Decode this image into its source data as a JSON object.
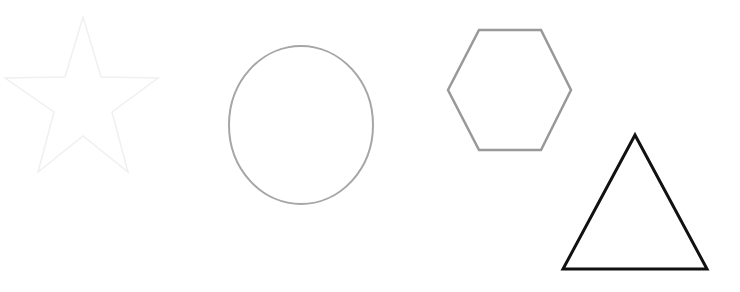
{
  "canvas": {
    "width": 740,
    "height": 292,
    "background": "#ffffff"
  },
  "shapes": [
    {
      "type": "star",
      "label": "star",
      "points": "83,17 101,77 158,78 112,112 128,172 83,136 38,172 54,112 5,78 65,77",
      "stroke": "#f0f0f0",
      "stroke_width": 1.5,
      "fill": "none"
    },
    {
      "type": "ellipse",
      "label": "circle",
      "cx": 301,
      "cy": 125,
      "rx": 72,
      "ry": 79,
      "stroke": "#a6a6a6",
      "stroke_width": 2,
      "fill": "none"
    },
    {
      "type": "hexagon",
      "label": "hexagon",
      "points": "479,30 541,30 571,90 541,150 479,150 448,90",
      "stroke": "#999999",
      "stroke_width": 2.5,
      "fill": "none"
    },
    {
      "type": "triangle",
      "label": "triangle",
      "points": "635,135 707,269 563,269",
      "stroke": "#111111",
      "stroke_width": 3,
      "fill": "none"
    }
  ]
}
